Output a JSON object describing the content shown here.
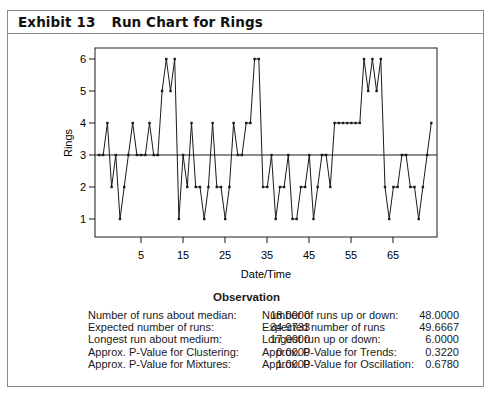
{
  "exhibit": {
    "number_label": "Exhibit 13",
    "title": "Run Chart for Rings"
  },
  "chart_data": {
    "type": "line",
    "title": "Run Chart for Rings",
    "xlabel": "Date/Time",
    "ylabel": "Rings",
    "x_tick_labels": [
      "5",
      "15",
      "25",
      "35",
      "45",
      "55",
      "65"
    ],
    "y_tick_labels": [
      "1",
      "2",
      "3",
      "4",
      "5",
      "6"
    ],
    "ylim": [
      0.6,
      6.4
    ],
    "median_line": 3,
    "grid": false,
    "legend": null,
    "values": [
      3,
      3,
      4,
      2,
      3,
      1,
      2,
      3,
      4,
      3,
      3,
      3,
      4,
      3,
      3,
      5,
      6,
      5,
      6,
      1,
      3,
      2,
      4,
      2,
      2,
      1,
      2,
      4,
      2,
      2,
      1,
      2,
      4,
      3,
      3,
      4,
      4,
      6,
      6,
      2,
      2,
      3,
      1,
      2,
      2,
      3,
      1,
      1,
      2,
      2,
      3,
      1,
      2,
      3,
      3,
      2,
      4,
      4,
      4,
      4,
      4,
      4,
      4,
      6,
      5,
      6,
      5,
      6,
      2,
      1,
      2,
      2,
      3,
      3,
      2,
      2,
      1,
      2,
      3,
      4
    ]
  },
  "stats": {
    "title": "Observation",
    "left": [
      {
        "label": "Number of runs about median:",
        "value": "18.0000"
      },
      {
        "label": "Expected number of runs:",
        "value": "34.9733"
      },
      {
        "label": "Longest run about medium:",
        "value": "17.0000"
      },
      {
        "label": "Approx. P-Value for Clustering:",
        "value": "0.0000"
      },
      {
        "label": "Approx. P-Value for Mixtures:",
        "value": "1.0000"
      }
    ],
    "right": [
      {
        "label": "Number of runs up or down:",
        "value": "48.0000"
      },
      {
        "label": "Expected number of runs",
        "value": "49.6667"
      },
      {
        "label": "Longest run up or down:",
        "value": "6.0000"
      },
      {
        "label": "Approx. P-Value for Trends:",
        "value": "0.3220"
      },
      {
        "label": "Approx. P-Value for Oscillation:",
        "value": "0.6780"
      }
    ]
  },
  "colors": {
    "frame": "#8a8a8a",
    "line": "#1a1a1a",
    "text": "#1a1a1a"
  }
}
